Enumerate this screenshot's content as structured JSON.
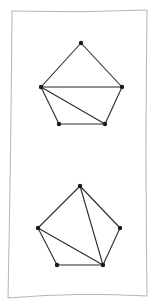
{
  "paper": {
    "corners": [
      [
        12,
        11
      ],
      [
        147,
        10
      ],
      [
        147,
        296
      ],
      [
        8,
        298
      ]
    ],
    "border_color": "#b4b4b4",
    "background": "#ffffff"
  },
  "diagrams": [
    {
      "name": "pentagon-triangulation-top",
      "vertices": {
        "top": [
          81,
          43
        ],
        "left": [
          41,
          87
        ],
        "right": [
          122,
          87
        ],
        "bottom_left": [
          59,
          124
        ],
        "bottom_right": [
          105,
          124
        ]
      },
      "edges": [
        [
          "top",
          "left"
        ],
        [
          "top",
          "right"
        ],
        [
          "right",
          "bottom_right"
        ],
        [
          "bottom_right",
          "bottom_left"
        ],
        [
          "bottom_left",
          "left"
        ],
        [
          "left",
          "right"
        ],
        [
          "left",
          "bottom_right"
        ]
      ]
    },
    {
      "name": "pentagon-triangulation-bottom",
      "vertices": {
        "top": [
          80,
          186
        ],
        "left": [
          38,
          228
        ],
        "right": [
          120,
          228
        ],
        "bottom_left": [
          57,
          265
        ],
        "bottom_right": [
          103,
          265
        ]
      },
      "edges": [
        [
          "top",
          "left"
        ],
        [
          "top",
          "right"
        ],
        [
          "right",
          "bottom_right"
        ],
        [
          "bottom_right",
          "bottom_left"
        ],
        [
          "bottom_left",
          "left"
        ],
        [
          "top",
          "bottom_right"
        ],
        [
          "left",
          "bottom_right"
        ]
      ]
    }
  ],
  "colors": {
    "edge": "#2a2a2a",
    "vertex": "#1a1a1a"
  }
}
